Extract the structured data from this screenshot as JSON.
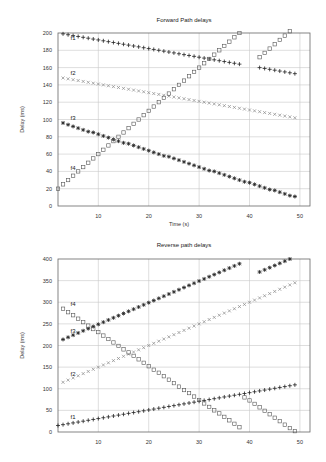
{
  "chart_data": [
    {
      "id": "forward",
      "type": "scatter",
      "title": "Forward Path delays",
      "xlabel": "Time (s)",
      "ylabel": "Delay (ms)",
      "xlim": [
        2,
        52
      ],
      "ylim": [
        0,
        200
      ],
      "xticks": [
        10,
        20,
        30,
        40,
        50
      ],
      "yticks": [
        0,
        20,
        40,
        60,
        80,
        100,
        120,
        140,
        160,
        180,
        200
      ],
      "grid": true,
      "legend": "inline labels",
      "series": [
        {
          "name": "f1",
          "marker": "plus",
          "color": "#222222",
          "label_pos": [
            4.5,
            192
          ],
          "x": [
            3,
            4,
            5,
            6,
            7,
            8,
            9,
            10,
            11,
            12,
            13,
            14,
            15,
            16,
            17,
            18,
            19,
            20,
            21,
            22,
            23,
            24,
            25,
            26,
            27,
            28,
            29,
            30,
            31,
            32,
            33,
            34,
            35,
            36,
            37,
            38,
            42,
            43,
            44,
            45,
            46,
            47,
            48,
            49
          ],
          "y": [
            199,
            198,
            197,
            196,
            195,
            194,
            193,
            192,
            191,
            190,
            189,
            188,
            187,
            186,
            185,
            184,
            183,
            182,
            181,
            180,
            179,
            178,
            177,
            176,
            175,
            174,
            173,
            172,
            171,
            170,
            169,
            168,
            167,
            166,
            165,
            164,
            160,
            159,
            158,
            157,
            156,
            155,
            154,
            153
          ]
        },
        {
          "name": "f2",
          "marker": "x",
          "color": "#888888",
          "label_pos": [
            4.5,
            152
          ],
          "x": [
            3,
            4,
            5,
            6,
            7,
            8,
            9,
            10,
            11,
            12,
            13,
            14,
            15,
            16,
            17,
            18,
            19,
            20,
            21,
            22,
            23,
            24,
            25,
            26,
            27,
            28,
            29,
            30,
            31,
            32,
            33,
            34,
            35,
            36,
            37,
            38,
            39,
            40,
            41,
            42,
            43,
            44,
            45,
            46,
            47,
            48,
            49
          ],
          "y": [
            148,
            147,
            146,
            145,
            144,
            143,
            142,
            141,
            140,
            139,
            138,
            137,
            136,
            135,
            134,
            133,
            132,
            131,
            130,
            129,
            128,
            127,
            126,
            125,
            124,
            123,
            122,
            121,
            120,
            119,
            118,
            117,
            116,
            115,
            114,
            113,
            112,
            111,
            110,
            109,
            108,
            107,
            106,
            105,
            104,
            103,
            102
          ]
        },
        {
          "name": "f3",
          "marker": "star",
          "color": "#222222",
          "label_pos": [
            4.5,
            100
          ],
          "x": [
            3,
            4,
            5,
            6,
            7,
            8,
            9,
            10,
            11,
            12,
            13,
            14,
            15,
            16,
            17,
            18,
            19,
            20,
            21,
            22,
            23,
            24,
            25,
            26,
            27,
            28,
            29,
            30,
            31,
            32,
            33,
            34,
            35,
            36,
            37,
            38,
            39,
            40,
            41,
            42,
            43,
            44,
            45,
            46,
            47,
            48,
            49
          ],
          "y": [
            96,
            94,
            92,
            90,
            88,
            86,
            85,
            83,
            81,
            79,
            77,
            75,
            73,
            72,
            70,
            68,
            66,
            64,
            62,
            60,
            58,
            57,
            55,
            53,
            51,
            49,
            47,
            45,
            43,
            41,
            40,
            38,
            36,
            34,
            32,
            30,
            28,
            27,
            25,
            23,
            21,
            19,
            18,
            16,
            14,
            12,
            11
          ]
        },
        {
          "name": "f4",
          "marker": "square",
          "color": "#555555",
          "label_pos": [
            4.5,
            42
          ],
          "x": [
            2,
            3,
            4,
            5,
            6,
            7,
            8,
            9,
            10,
            11,
            12,
            13,
            14,
            15,
            16,
            17,
            18,
            19,
            20,
            21,
            22,
            23,
            24,
            25,
            26,
            27,
            28,
            29,
            30,
            31,
            32,
            33,
            34,
            35,
            36,
            37,
            38,
            42,
            43,
            44,
            45,
            46,
            47,
            48,
            49
          ],
          "y": [
            20,
            25,
            30,
            35,
            40,
            45,
            50,
            55,
            60,
            65,
            70,
            75,
            80,
            85,
            90,
            95,
            100,
            105,
            110,
            115,
            120,
            125,
            130,
            135,
            140,
            145,
            150,
            155,
            160,
            165,
            170,
            175,
            180,
            185,
            190,
            195,
            200,
            172,
            177,
            182,
            187,
            192,
            197,
            202,
            207
          ]
        }
      ]
    },
    {
      "id": "reverse",
      "type": "scatter",
      "title": "Reverse path delays",
      "xlabel": "",
      "ylabel": "Delay (ms)",
      "xlim": [
        2,
        52
      ],
      "ylim": [
        0,
        400
      ],
      "xticks": [
        10,
        20,
        30,
        40,
        50
      ],
      "yticks": [
        0,
        50,
        100,
        150,
        200,
        250,
        300,
        350,
        400
      ],
      "grid": true,
      "legend": "inline labels",
      "series": [
        {
          "name": "f1",
          "marker": "plus",
          "color": "#222222",
          "label_pos": [
            4.5,
            30
          ],
          "x": [
            2,
            3,
            4,
            5,
            6,
            7,
            8,
            9,
            10,
            11,
            12,
            13,
            14,
            15,
            16,
            17,
            18,
            19,
            20,
            21,
            22,
            23,
            24,
            25,
            26,
            27,
            28,
            29,
            30,
            31,
            32,
            33,
            34,
            35,
            36,
            37,
            38,
            39,
            40,
            41,
            42,
            43,
            44,
            45,
            46,
            47,
            48,
            49
          ],
          "y": [
            15,
            17,
            19,
            21,
            23,
            25,
            27,
            29,
            31,
            33,
            35,
            37,
            39,
            41,
            43,
            45,
            47,
            49,
            51,
            53,
            55,
            57,
            59,
            61,
            63,
            65,
            67,
            69,
            71,
            73,
            75,
            77,
            79,
            81,
            83,
            85,
            87,
            89,
            91,
            93,
            95,
            97,
            99,
            101,
            103,
            105,
            107,
            109
          ]
        },
        {
          "name": "f2",
          "marker": "x",
          "color": "#888888",
          "label_pos": [
            4.5,
            130
          ],
          "x": [
            3,
            4,
            5,
            6,
            7,
            8,
            9,
            10,
            11,
            12,
            13,
            14,
            15,
            16,
            17,
            18,
            19,
            20,
            21,
            22,
            23,
            24,
            25,
            26,
            27,
            28,
            29,
            30,
            31,
            32,
            33,
            34,
            35,
            36,
            37,
            38,
            39,
            40,
            41,
            42,
            43,
            44,
            45,
            46,
            47,
            48,
            49
          ],
          "y": [
            115,
            120,
            125,
            130,
            135,
            140,
            145,
            150,
            155,
            160,
            165,
            170,
            175,
            180,
            185,
            190,
            195,
            200,
            205,
            210,
            215,
            220,
            225,
            230,
            235,
            240,
            245,
            250,
            255,
            260,
            265,
            270,
            275,
            280,
            285,
            290,
            295,
            300,
            305,
            310,
            315,
            320,
            325,
            330,
            335,
            340,
            345
          ]
        },
        {
          "name": "f3",
          "marker": "star",
          "color": "#222222",
          "label_pos": [
            4.5,
            230
          ],
          "x": [
            3,
            4,
            5,
            6,
            7,
            8,
            9,
            10,
            11,
            12,
            13,
            14,
            15,
            16,
            17,
            18,
            19,
            20,
            21,
            22,
            23,
            24,
            25,
            26,
            27,
            28,
            29,
            30,
            31,
            32,
            33,
            34,
            35,
            36,
            37,
            38,
            42,
            43,
            44,
            45,
            46,
            47,
            48,
            49
          ],
          "y": [
            214,
            219,
            224,
            229,
            234,
            239,
            244,
            249,
            254,
            259,
            264,
            269,
            274,
            279,
            284,
            289,
            294,
            299,
            304,
            309,
            314,
            319,
            324,
            329,
            334,
            339,
            344,
            349,
            354,
            359,
            364,
            369,
            374,
            379,
            384,
            389,
            370,
            375,
            380,
            385,
            390,
            395,
            400,
            405
          ]
        },
        {
          "name": "f4",
          "marker": "square",
          "color": "#555555",
          "label_pos": [
            4.5,
            292
          ],
          "x": [
            3,
            4,
            5,
            6,
            7,
            8,
            9,
            10,
            11,
            12,
            13,
            14,
            15,
            16,
            17,
            18,
            19,
            20,
            21,
            22,
            23,
            24,
            25,
            26,
            27,
            28,
            29,
            30,
            31,
            32,
            33,
            34,
            35,
            36,
            37,
            38,
            39,
            40,
            41,
            42,
            43,
            44,
            45,
            46,
            47,
            48,
            49
          ],
          "y": [
            285,
            277,
            270,
            262,
            254,
            246,
            238,
            231,
            223,
            215,
            207,
            199,
            191,
            184,
            176,
            168,
            160,
            152,
            144,
            137,
            129,
            121,
            113,
            105,
            97,
            90,
            82,
            74,
            66,
            58,
            50,
            43,
            35,
            27,
            19,
            11,
            80,
            73,
            65,
            57,
            49,
            41,
            33,
            25,
            17,
            9,
            2
          ]
        }
      ]
    }
  ]
}
